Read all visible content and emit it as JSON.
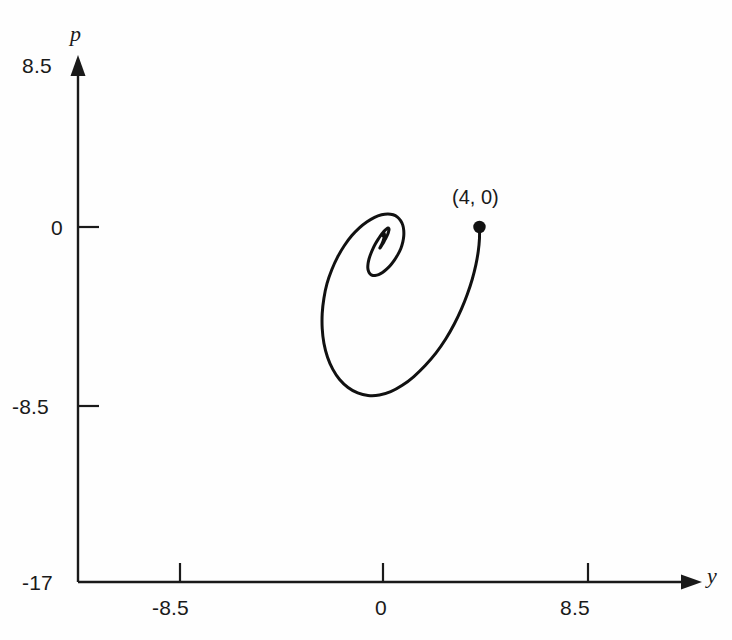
{
  "figure": {
    "background_color": "#fefefe",
    "curve_color": "#111111",
    "axis_color": "#1a1a1a"
  },
  "axes": {
    "vertical": {
      "name": "p",
      "ticks": [
        "8.5",
        "0",
        "-8.5",
        "-17"
      ]
    },
    "horizontal": {
      "name": "y",
      "ticks": [
        "-8.5",
        "0",
        "8.5"
      ]
    }
  },
  "annotations": {
    "start_point": "(4, 0)"
  },
  "chart_data": {
    "type": "line",
    "title": "",
    "subtitle": "",
    "xlabel": "y",
    "ylabel": "p",
    "grid": false,
    "legend": null,
    "xlim": [
      -17,
      11.5
    ],
    "ylim": [
      -17,
      8.5
    ],
    "xticks": [
      -8.5,
      0,
      8.5
    ],
    "xticklabels": [
      "-8.5",
      "0",
      "8.5"
    ],
    "yticks": [
      8.5,
      0,
      -8.5,
      -17
    ],
    "yticklabels": [
      "8.5",
      "0",
      "-8.5",
      "-17"
    ],
    "markers": [
      {
        "label": "(4, 0)",
        "x": 4.0,
        "y": 0.0,
        "style": "filled-circle"
      }
    ],
    "series": [
      {
        "name": "trajectory",
        "x": [
          4.0,
          4.0,
          3.95,
          3.85,
          3.7,
          3.5,
          3.25,
          2.95,
          2.6,
          2.2,
          1.75,
          1.28,
          0.8,
          0.32,
          -0.15,
          -0.62,
          -1.05,
          -1.45,
          -1.8,
          -2.08,
          -2.3,
          -2.45,
          -2.52,
          -2.52,
          -2.45,
          -2.32,
          -2.12,
          -1.88,
          -1.6,
          -1.3,
          -0.98,
          -0.66,
          -0.35,
          -0.06,
          0.2,
          0.42,
          0.6,
          0.73,
          0.82,
          0.86,
          0.86,
          0.82,
          0.74,
          0.62,
          0.48,
          0.32,
          0.15,
          -0.02,
          -0.18,
          -0.33,
          -0.45,
          -0.54,
          -0.6,
          -0.63,
          -0.62,
          -0.58,
          -0.51,
          -0.42,
          -0.32,
          -0.21,
          -0.1,
          0.0,
          0.09,
          0.16,
          0.21,
          0.24,
          0.25,
          0.23,
          0.2,
          0.15,
          0.09,
          0.03,
          -0.03,
          -0.08,
          -0.11,
          -0.13,
          -0.13,
          -0.11,
          -0.08,
          -0.04,
          0.0,
          0.03,
          0.05,
          0.06,
          0.05,
          0.03,
          0.01,
          -0.01,
          -0.02,
          -0.02,
          0.0
        ],
        "y": [
          0.0,
          -0.55,
          -1.15,
          -1.8,
          -2.48,
          -3.18,
          -3.9,
          -4.62,
          -5.32,
          -5.98,
          -6.58,
          -7.1,
          -7.52,
          -7.82,
          -7.98,
          -8.0,
          -7.88,
          -7.62,
          -7.24,
          -6.76,
          -6.18,
          -5.52,
          -4.82,
          -4.1,
          -3.38,
          -2.68,
          -2.02,
          -1.42,
          -0.88,
          -0.42,
          -0.04,
          0.25,
          0.46,
          0.58,
          0.62,
          0.58,
          0.47,
          0.3,
          0.09,
          -0.16,
          -0.43,
          -0.72,
          -1.02,
          -1.3,
          -1.56,
          -1.8,
          -2.0,
          -2.16,
          -2.26,
          -2.3,
          -2.29,
          -2.22,
          -2.1,
          -1.94,
          -1.74,
          -1.52,
          -1.28,
          -1.04,
          -0.81,
          -0.6,
          -0.41,
          -0.26,
          -0.15,
          -0.08,
          -0.05,
          -0.07,
          -0.13,
          -0.22,
          -0.33,
          -0.46,
          -0.59,
          -0.72,
          -0.83,
          -0.92,
          -0.98,
          -1.0,
          -0.99,
          -0.95,
          -0.88,
          -0.79,
          -0.68,
          -0.57,
          -0.47,
          -0.38,
          -0.31,
          -0.27,
          -0.26,
          -0.28,
          -0.32,
          -0.37,
          -0.42
        ]
      }
    ]
  }
}
